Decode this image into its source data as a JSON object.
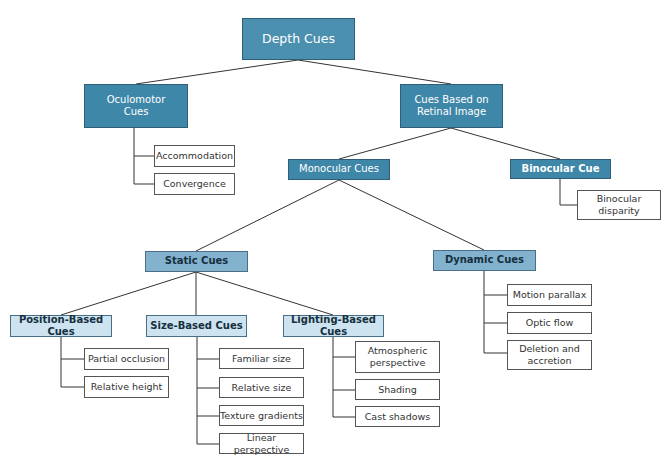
{
  "diagram": {
    "root": "Depth Cues",
    "level1": {
      "oculomotor": "Oculomotor Cues",
      "retinal": "Cues Based on Retinal Image"
    },
    "oculomotor_leaves": [
      "Accommodation",
      "Convergence"
    ],
    "level2": {
      "monocular": "Monocular Cues",
      "binocular": "Binocular Cue"
    },
    "binocular_leaves": [
      "Binocular disparity"
    ],
    "level3": {
      "static": "Static Cues",
      "dynamic": "Dynamic Cues"
    },
    "static_children": {
      "position": "Position-Based Cues",
      "size": "Size-Based Cues",
      "lighting": "Lighting-Based Cues"
    },
    "position_leaves": [
      "Partial occlusion",
      "Relative height"
    ],
    "size_leaves": [
      "Familiar size",
      "Relative size",
      "Texture gradients",
      "Linear perspective"
    ],
    "lighting_leaves": [
      "Atmospheric perspective",
      "Shading",
      "Cast shadows"
    ],
    "dynamic_leaves": [
      "Motion parallax",
      "Optic flow",
      "Deletion and accretion"
    ]
  },
  "colors": {
    "primary_box": "#3f87a8",
    "secondary_box": "#83b2ce",
    "tertiary_box": "#cde3ef",
    "leaf_box": "#ffffff",
    "line": "#333333"
  }
}
